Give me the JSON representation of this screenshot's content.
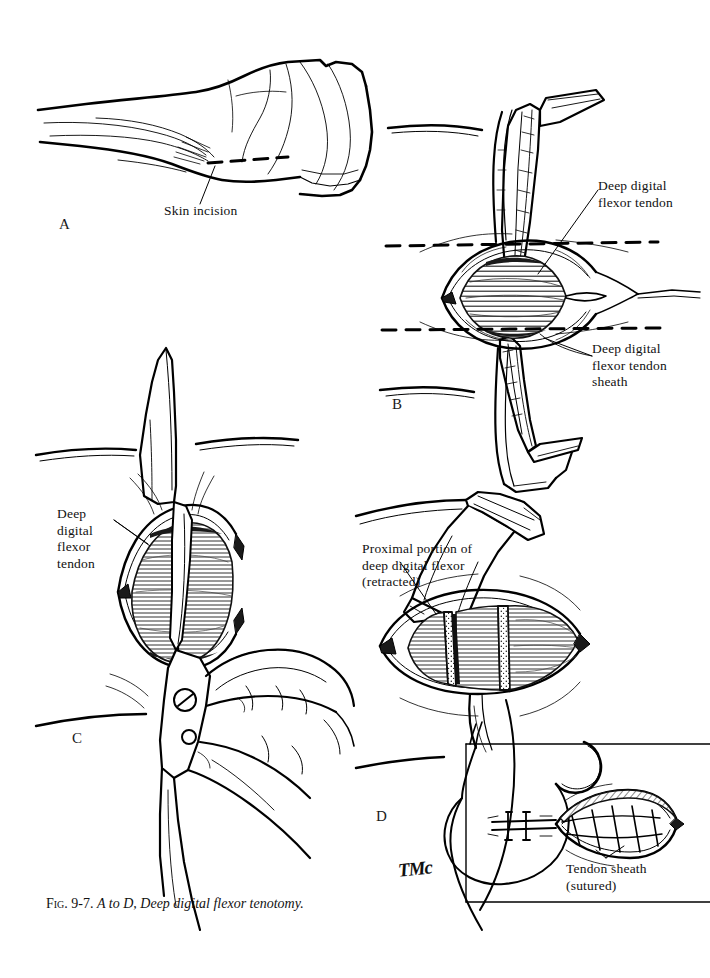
{
  "figure": {
    "background_color": "#ffffff",
    "ink_color": "#000000",
    "caption": {
      "fig_prefix": "Fig.",
      "number": "9-7.",
      "range": "A to D,",
      "title": "Deep digital flexor tenotomy.",
      "full_text": "Fig. 9-7. A to D, Deep digital flexor tenotomy."
    },
    "artist_signature": "TMc"
  },
  "panels": [
    {
      "letter": "A",
      "subject": "lateral view of equine distal limb and hoof",
      "labels": [
        {
          "name": "skin-incision",
          "text": "Skin incision"
        }
      ]
    },
    {
      "letter": "B",
      "subject": "incised pastern with retractors exposing deep digital flexor tendon",
      "labels": [
        {
          "name": "deep-digital-flexor-tendon",
          "text": "Deep digital\nflexor tendon"
        },
        {
          "name": "deep-digital-flexor-tendon-sheath",
          "text": "Deep digital\nflexor tendon\nsheath"
        }
      ]
    },
    {
      "letter": "C",
      "subject": "scissors transecting the deep digital flexor tendon along dashed cut line",
      "labels": [
        {
          "name": "deep-digital-flexor-tendon",
          "text": "Deep\ndigital\nflexor\ntendon"
        }
      ]
    },
    {
      "letter": "D",
      "subject": "transected tendon with proximal stump retracted by forceps",
      "labels": [
        {
          "name": "proximal-portion-deep-digital-flexor",
          "text": "Proximal portion of\ndeep digital flexor\n(retracted)"
        }
      ],
      "inset": {
        "name": "sutured-sheath-inset",
        "subject": "closure of tendon sheath with simple continuous suture and curved needle",
        "labels": [
          {
            "name": "tendon-sheath-sutured",
            "text": "Tendon sheath\n(sutured)"
          }
        ]
      }
    }
  ]
}
